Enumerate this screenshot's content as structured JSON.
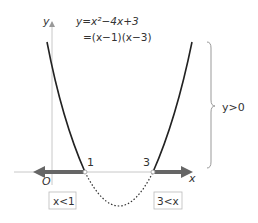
{
  "equation": {
    "line1": "y=x²−4x+3",
    "line2": "=(x−1)(x−3)"
  },
  "axes": {
    "x_label": "x",
    "y_label": "y",
    "origin_label": "O"
  },
  "roots": {
    "left": "1",
    "right": "3"
  },
  "regions": {
    "left_box": "x<1",
    "right_box": "3<x",
    "brace_label": "y>0"
  },
  "colors": {
    "curve": "#222222",
    "axis": "#bbbbbb",
    "arrow": "#666666",
    "box_border": "#aaaaaa",
    "brace": "#999999"
  }
}
